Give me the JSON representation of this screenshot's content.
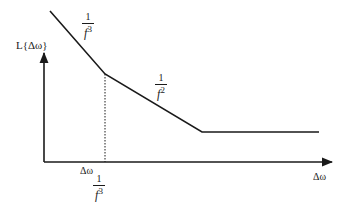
{
  "diagram": {
    "type": "phase-noise-spectrum",
    "y_axis": {
      "label": "L{Δω}"
    },
    "x_axis": {
      "label": "Δω"
    },
    "regions": [
      {
        "slope_label": {
          "numerator": "1",
          "denominator": "f",
          "exponent": "3"
        }
      },
      {
        "slope_label": {
          "numerator": "1",
          "denominator": "f",
          "exponent": "2"
        }
      },
      {
        "slope_label": null,
        "description": "flat noise floor"
      }
    ],
    "corner_marker": {
      "label": "Δω",
      "subscript": {
        "numerator": "1",
        "denominator": "f",
        "exponent": "3"
      },
      "style": "dotted vertical line"
    },
    "colors": {
      "ink": "#1a1a1a",
      "background": "#ffffff"
    }
  }
}
